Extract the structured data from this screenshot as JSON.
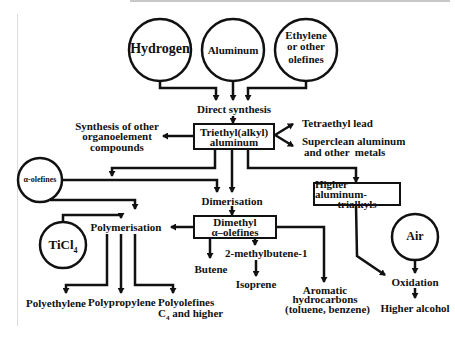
{
  "diagram": {
    "type": "flowchart",
    "inputs": {
      "hydrogen": "Hydrogen",
      "aluminum": "Aluminum",
      "ethylene_line1": "Ethylene",
      "ethylene_line2": "or other",
      "ethylene_line3": "olefines",
      "alpha_olefines": "α-olefines",
      "ticl4": "TiCl",
      "ticl4_sub": "4",
      "air": "Air"
    },
    "processes": {
      "direct_synthesis": "Direct synthesis",
      "dimerisation": "Dimerisation",
      "polymerisation": "Polymerisation",
      "oxidation": "Oxidation"
    },
    "boxes": {
      "triethyl_line1": "Triethyl(alkyl)",
      "triethyl_line2": "aluminum",
      "dimethyl_line1": "Dimethyl",
      "dimethyl_line2": "α–olefines",
      "higher_line1": "Higher aluminum-",
      "higher_line2": "trialkyls"
    },
    "products": {
      "synthesis_other_line1": "Synthesis of other",
      "synthesis_other_line2": "organoelement",
      "synthesis_other_line3": "compounds",
      "tetraethyl_lead": "Tetraethyl lead",
      "superclean_line1": "Superclean aluminum",
      "superclean_line2": "and other  metals",
      "butene": "Butene",
      "methylbutene": "2-methylbutene-1",
      "isoprene": "Isoprene",
      "aromatic_line1": "Aromatic",
      "aromatic_line2": "hydrocarbons",
      "aromatic_line3": "(toluene, benzene)",
      "polyethylene": "Polyethylene",
      "polypropylene": "Polypropylene",
      "polyolefines_line1": "Polyolefines",
      "polyolefines_line2_pre": "C",
      "polyolefines_line2_sub": "4",
      "polyolefines_line2_post": " and higher",
      "higher_alcohol": "Higher alcohol"
    },
    "colors": {
      "ink": "#111111",
      "background": "#ffffff"
    }
  }
}
